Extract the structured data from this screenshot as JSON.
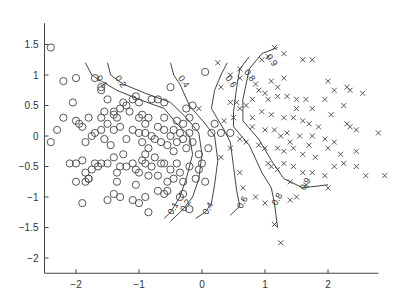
{
  "chart_data": {
    "type": "scatter",
    "title": "",
    "xlabel": "",
    "ylabel": "",
    "xlim": [
      -2.5,
      2.8
    ],
    "ylim": [
      -2.25,
      1.85
    ],
    "xticks": [
      -2,
      -1,
      0,
      1,
      2
    ],
    "xtick_labels": [
      "−2",
      "−1",
      "0",
      "1",
      "2"
    ],
    "yticks": [
      -2,
      -1.5,
      -1,
      -0.5,
      0,
      0.5,
      1,
      1.5
    ],
    "ytick_labels": [
      "−2",
      "−1.5",
      "−1",
      "−0.5",
      "0",
      "0.5",
      "1",
      "1.5"
    ],
    "grid": false,
    "legend": null,
    "series": [
      {
        "name": "class-circle",
        "marker": "o",
        "points": [
          [
            -2.4,
            1.45
          ],
          [
            -2.2,
            0.9
          ],
          [
            -2.0,
            0.95
          ],
          [
            -1.7,
            0.95
          ],
          [
            -1.6,
            0.8
          ],
          [
            -1.6,
            0.75
          ],
          [
            -1.5,
            0.6
          ],
          [
            -1.4,
            0.4
          ],
          [
            -1.4,
            0.35
          ],
          [
            -2.4,
            -0.1
          ],
          [
            -2.3,
            0.1
          ],
          [
            -2.2,
            0.3
          ],
          [
            -2.05,
            0.55
          ],
          [
            -2.0,
            0.25
          ],
          [
            -1.95,
            0.2
          ],
          [
            -1.9,
            0.15
          ],
          [
            -1.85,
            -0.1
          ],
          [
            -1.8,
            0.3
          ],
          [
            -1.75,
            0.0
          ],
          [
            -1.7,
            0.05
          ],
          [
            -1.6,
            0.1
          ],
          [
            -1.55,
            -0.05
          ],
          [
            -1.5,
            0.2
          ],
          [
            -1.4,
            0.1
          ],
          [
            -1.35,
            0.3
          ],
          [
            -1.3,
            0.15
          ],
          [
            -1.25,
            0.55
          ],
          [
            -1.2,
            0.5
          ],
          [
            -1.15,
            0.4
          ],
          [
            -1.1,
            0.6
          ],
          [
            -1.05,
            0.65
          ],
          [
            -1.0,
            0.55
          ],
          [
            -0.95,
            0.35
          ],
          [
            -0.9,
            0.2
          ],
          [
            -0.85,
            0.3
          ],
          [
            -0.8,
            0.6
          ],
          [
            -0.7,
            0.6
          ],
          [
            -0.6,
            0.55
          ],
          [
            -0.5,
            0.8
          ],
          [
            -0.45,
            0.1
          ],
          [
            -0.4,
            0.25
          ],
          [
            -0.35,
            0.05
          ],
          [
            -0.3,
            0.2
          ],
          [
            -1.2,
            -0.05
          ],
          [
            -1.1,
            0.1
          ],
          [
            -1.0,
            0.05
          ],
          [
            -0.95,
            -0.1
          ],
          [
            -0.9,
            0.05
          ],
          [
            -0.85,
            -0.2
          ],
          [
            -0.8,
            0.0
          ],
          [
            -0.75,
            -0.05
          ],
          [
            -0.7,
            0.15
          ],
          [
            -0.65,
            -0.1
          ],
          [
            -0.6,
            0.1
          ],
          [
            -0.55,
            -0.15
          ],
          [
            -0.5,
            0.0
          ],
          [
            -0.45,
            -0.25
          ],
          [
            -0.4,
            -0.1
          ],
          [
            -0.3,
            -0.05
          ],
          [
            -0.25,
            -0.2
          ],
          [
            -0.2,
            0.05
          ],
          [
            -0.15,
            -0.1
          ],
          [
            -0.1,
            0.15
          ],
          [
            -0.05,
            -0.3
          ],
          [
            -2.1,
            -0.45
          ],
          [
            -2.0,
            -0.45
          ],
          [
            -1.9,
            -0.4
          ],
          [
            -1.85,
            -0.6
          ],
          [
            -1.8,
            -0.7
          ],
          [
            -1.75,
            -0.55
          ],
          [
            -1.7,
            -0.45
          ],
          [
            -1.65,
            -0.5
          ],
          [
            -1.6,
            -0.45
          ],
          [
            -1.5,
            -0.45
          ],
          [
            -1.4,
            -0.35
          ],
          [
            -1.35,
            -0.6
          ],
          [
            -1.3,
            -0.5
          ],
          [
            -1.2,
            -0.5
          ],
          [
            -1.1,
            -0.45
          ],
          [
            -1.05,
            -0.55
          ],
          [
            -1.0,
            -0.6
          ],
          [
            -0.95,
            -0.4
          ],
          [
            -0.9,
            -0.45
          ],
          [
            -0.85,
            -0.65
          ],
          [
            -0.8,
            -0.5
          ],
          [
            -0.7,
            -0.65
          ],
          [
            -0.65,
            -0.45
          ],
          [
            -0.6,
            -0.45
          ],
          [
            -0.5,
            -0.55
          ],
          [
            -0.45,
            -0.7
          ],
          [
            -0.4,
            -0.45
          ],
          [
            -0.35,
            -0.6
          ],
          [
            -0.3,
            -0.75
          ],
          [
            -0.2,
            -0.5
          ],
          [
            -0.1,
            -0.7
          ],
          [
            -0.05,
            -0.55
          ],
          [
            -2.0,
            -0.75
          ],
          [
            -1.85,
            -0.75
          ],
          [
            -1.8,
            -0.7
          ],
          [
            -1.35,
            -0.75
          ],
          [
            -1.05,
            -0.8
          ],
          [
            -0.55,
            -0.75
          ],
          [
            -0.3,
            -0.95
          ],
          [
            -0.35,
            -1.0
          ],
          [
            -0.55,
            -0.9
          ],
          [
            -0.6,
            -0.95
          ],
          [
            -0.7,
            -0.9
          ],
          [
            -0.9,
            -1.0
          ],
          [
            -1.0,
            -1.1
          ],
          [
            -1.1,
            -1.05
          ],
          [
            -1.3,
            -1.0
          ],
          [
            -1.4,
            -0.95
          ],
          [
            -1.5,
            -1.05
          ],
          [
            -1.9,
            -1.1
          ],
          [
            -0.85,
            -1.25
          ],
          [
            -0.2,
            -1.2
          ],
          [
            0.05,
            -0.75
          ],
          [
            0.0,
            -0.45
          ],
          [
            0.1,
            -0.2
          ],
          [
            0.15,
            0.05
          ],
          [
            -0.25,
            0.45
          ],
          [
            -0.15,
            0.5
          ],
          [
            0.05,
            1.05
          ],
          [
            -1.6,
            0.3
          ],
          [
            -1.45,
            -0.15
          ],
          [
            -1.25,
            -0.3
          ],
          [
            -0.9,
            -0.3
          ],
          [
            -0.75,
            -0.35
          ],
          [
            -1.55,
            0.4
          ],
          [
            -1.3,
            0.45
          ],
          [
            -1.0,
            0.3
          ],
          [
            -0.6,
            0.3
          ],
          [
            -0.2,
            0.3
          ],
          [
            0.2,
            0.2
          ],
          [
            0.3,
            0.05
          ],
          [
            0.45,
            0.05
          ]
        ]
      },
      {
        "name": "class-cross",
        "marker": "x",
        "points": [
          [
            1.15,
            1.45
          ],
          [
            1.3,
            1.35
          ],
          [
            1.05,
            1.3
          ],
          [
            0.95,
            1.25
          ],
          [
            1.6,
            1.25
          ],
          [
            1.75,
            1.25
          ],
          [
            0.6,
            1.1
          ],
          [
            1.3,
            0.95
          ],
          [
            0.6,
            0.95
          ],
          [
            1.1,
            0.9
          ],
          [
            0.85,
            0.85
          ],
          [
            1.2,
            0.8
          ],
          [
            2.0,
            0.9
          ],
          [
            2.3,
            0.8
          ],
          [
            2.35,
            0.75
          ],
          [
            2.55,
            0.7
          ],
          [
            0.9,
            0.75
          ],
          [
            1.0,
            0.7
          ],
          [
            1.2,
            0.65
          ],
          [
            1.35,
            0.65
          ],
          [
            1.5,
            0.6
          ],
          [
            1.65,
            0.6
          ],
          [
            0.45,
            0.55
          ],
          [
            0.55,
            0.55
          ],
          [
            0.7,
            0.5
          ],
          [
            0.8,
            0.6
          ],
          [
            1.05,
            0.6
          ],
          [
            1.5,
            0.45
          ],
          [
            1.75,
            0.45
          ],
          [
            2.25,
            0.5
          ],
          [
            0.6,
            0.45
          ],
          [
            0.95,
            0.4
          ],
          [
            1.1,
            0.35
          ],
          [
            1.3,
            0.3
          ],
          [
            1.45,
            0.3
          ],
          [
            1.6,
            0.25
          ],
          [
            1.7,
            0.2
          ],
          [
            2.3,
            0.2
          ],
          [
            2.35,
            0.15
          ],
          [
            2.45,
            0.1
          ],
          [
            2.8,
            0.05
          ],
          [
            0.8,
            0.15
          ],
          [
            1.0,
            0.1
          ],
          [
            1.15,
            0.1
          ],
          [
            1.35,
            0.05
          ],
          [
            1.55,
            0.0
          ],
          [
            1.75,
            0.0
          ],
          [
            1.95,
            -0.05
          ],
          [
            2.1,
            -0.1
          ],
          [
            0.6,
            -0.05
          ],
          [
            0.7,
            -0.1
          ],
          [
            0.9,
            -0.15
          ],
          [
            1.0,
            -0.2
          ],
          [
            1.2,
            -0.2
          ],
          [
            1.3,
            -0.25
          ],
          [
            1.45,
            -0.2
          ],
          [
            1.6,
            -0.3
          ],
          [
            1.8,
            -0.35
          ],
          [
            2.0,
            -0.2
          ],
          [
            2.2,
            -0.3
          ],
          [
            2.45,
            -0.25
          ],
          [
            1.05,
            -0.45
          ],
          [
            1.1,
            -0.5
          ],
          [
            1.2,
            -0.55
          ],
          [
            1.3,
            -0.45
          ],
          [
            1.45,
            -0.5
          ],
          [
            1.6,
            -0.6
          ],
          [
            1.75,
            -0.6
          ],
          [
            1.95,
            -0.65
          ],
          [
            2.1,
            -0.5
          ],
          [
            2.25,
            -0.45
          ],
          [
            2.45,
            -0.5
          ],
          [
            2.6,
            -0.65
          ],
          [
            1.4,
            -0.75
          ],
          [
            1.65,
            -0.8
          ],
          [
            2.0,
            -0.85
          ],
          [
            2.9,
            -0.65
          ],
          [
            1.4,
            -1.05
          ],
          [
            1.5,
            -1.0
          ],
          [
            1.15,
            -1.45
          ],
          [
            1.25,
            -1.75
          ],
          [
            1.0,
            -1.1
          ],
          [
            0.85,
            -1.0
          ],
          [
            0.65,
            -0.85
          ],
          [
            0.6,
            -0.6
          ],
          [
            0.3,
            -0.35
          ],
          [
            0.45,
            -0.2
          ],
          [
            0.35,
            0.25
          ],
          [
            0.5,
            0.3
          ],
          [
            -0.05,
            0.45
          ],
          [
            0.3,
            0.8
          ],
          [
            0.25,
            1.2
          ],
          [
            0.45,
            1.0
          ],
          [
            1.25,
            0.0
          ],
          [
            1.4,
            -0.1
          ],
          [
            1.7,
            -0.15
          ],
          [
            1.85,
            0.15
          ],
          [
            2.05,
            0.35
          ],
          [
            1.95,
            0.6
          ],
          [
            2.1,
            0.75
          ],
          [
            0.8,
            0.3
          ]
        ]
      }
    ],
    "contours": [
      {
        "level": 0.1,
        "label": "0.1"
      },
      {
        "level": 0.2,
        "label": "0.2"
      },
      {
        "level": 0.4,
        "label": "0.4"
      },
      {
        "level": 0.6,
        "label": "0.6"
      },
      {
        "level": 0.8,
        "label": "0.8"
      },
      {
        "level": 0.9,
        "label": "0.9"
      }
    ]
  }
}
